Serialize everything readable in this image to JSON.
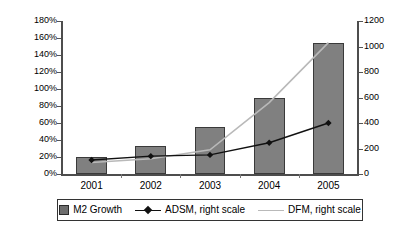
{
  "chart_data": {
    "type": "bar",
    "title": "",
    "xlabel": "",
    "ylabel": "",
    "categories": [
      "2001",
      "2002",
      "2003",
      "2004",
      "2005"
    ],
    "grid": false,
    "legend_position": "bottom",
    "y_left": {
      "label": "",
      "ticks": [
        "0%",
        "20%",
        "40%",
        "60%",
        "80%",
        "100%",
        "120%",
        "140%",
        "160%",
        "180%"
      ],
      "values": [
        0,
        20,
        40,
        60,
        80,
        100,
        120,
        140,
        160,
        180
      ],
      "lim": [
        0,
        180
      ],
      "unit": "%"
    },
    "y_right": {
      "label": "",
      "ticks": [
        "0",
        "200",
        "400",
        "600",
        "800",
        "1000",
        "1200"
      ],
      "values": [
        0,
        200,
        400,
        600,
        800,
        1000,
        1200
      ],
      "lim": [
        0,
        1200
      ]
    },
    "series": [
      {
        "name": "M2 Growth",
        "type": "bar",
        "axis": "left",
        "color": "#808080",
        "values": [
          20,
          33,
          55,
          90,
          154
        ]
      },
      {
        "name": "ADSM, right scale",
        "type": "line",
        "axis": "right",
        "color": "#111111",
        "marker": "diamond",
        "values": [
          110,
          140,
          150,
          245,
          400
        ]
      },
      {
        "name": "DFM, right scale",
        "type": "line",
        "axis": "right",
        "color": "#b9b9b9",
        "marker": "none",
        "values": [
          90,
          120,
          190,
          560,
          1030
        ]
      }
    ]
  },
  "legend": {
    "items": [
      {
        "label": "M2 Growth",
        "marker": "square"
      },
      {
        "label": "ADSM, right scale",
        "marker": "line-diamond"
      },
      {
        "label": "DFM, right scale",
        "marker": "line-light"
      }
    ]
  }
}
